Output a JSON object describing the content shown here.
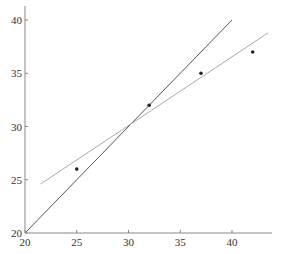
{
  "chart_data": {
    "type": "scatter",
    "title": "",
    "xlabel": "",
    "ylabel": "",
    "xlim": [
      20,
      44
    ],
    "ylim": [
      20,
      41
    ],
    "x_ticks": [
      20,
      25,
      30,
      35,
      40
    ],
    "y_ticks": [
      20,
      25,
      30,
      35,
      40
    ],
    "grid": false,
    "legend": null,
    "points": [
      {
        "x": 25,
        "y": 26
      },
      {
        "x": 32,
        "y": 32
      },
      {
        "x": 37,
        "y": 35
      },
      {
        "x": 42,
        "y": 37
      }
    ],
    "lines": [
      {
        "name": "identity",
        "x": [
          20,
          40
        ],
        "y": [
          20,
          40
        ],
        "color": "#555555"
      },
      {
        "name": "fit",
        "x": [
          21.5,
          43.5
        ],
        "y": [
          24.6,
          38.8
        ],
        "color": "#aaaaaa"
      }
    ]
  }
}
